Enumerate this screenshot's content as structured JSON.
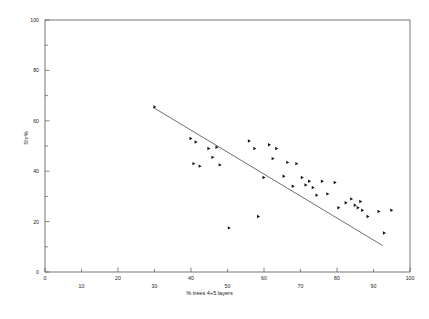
{
  "chart_data": {
    "type": "scatter",
    "title": "",
    "xlabel": "% trees 4+5 layers",
    "ylabel": "Shr%",
    "xlim": [
      0,
      100
    ],
    "ylim": [
      0,
      100
    ],
    "grid": false,
    "legend": null,
    "x_major_ticks": [
      0,
      20,
      40,
      60,
      80,
      100
    ],
    "x_minor_ticks": [
      10,
      30,
      50,
      70,
      90
    ],
    "x_tick_labels_upper": [
      "0",
      "20",
      "40",
      "60",
      "80",
      "100"
    ],
    "x_tick_labels_lower": [
      "10",
      "30",
      "50",
      "70",
      "90"
    ],
    "y_major_ticks": [
      0,
      20,
      40,
      60,
      80,
      100
    ],
    "y_minor_ticks": [
      10,
      30,
      50,
      70,
      90
    ],
    "y_tick_labels": [
      "0",
      "20",
      "40",
      "60",
      "80",
      "100"
    ],
    "marker_style": "right-pointing-triangle",
    "points": [
      {
        "x": 30.1,
        "y": 65.5
      },
      {
        "x": 40.0,
        "y": 53.0
      },
      {
        "x": 41.4,
        "y": 51.6
      },
      {
        "x": 40.8,
        "y": 43.0
      },
      {
        "x": 42.5,
        "y": 42.0
      },
      {
        "x": 44.9,
        "y": 49.0
      },
      {
        "x": 46.0,
        "y": 45.5
      },
      {
        "x": 47.1,
        "y": 49.5
      },
      {
        "x": 48.0,
        "y": 42.5
      },
      {
        "x": 56.0,
        "y": 52.0
      },
      {
        "x": 57.5,
        "y": 49.0
      },
      {
        "x": 58.5,
        "y": 22.0
      },
      {
        "x": 60.0,
        "y": 37.5
      },
      {
        "x": 61.5,
        "y": 50.5
      },
      {
        "x": 62.5,
        "y": 45.0
      },
      {
        "x": 63.5,
        "y": 49.0
      },
      {
        "x": 65.5,
        "y": 38.0
      },
      {
        "x": 66.5,
        "y": 43.5
      },
      {
        "x": 68.0,
        "y": 34.0
      },
      {
        "x": 69.0,
        "y": 43.0
      },
      {
        "x": 70.5,
        "y": 37.5
      },
      {
        "x": 71.5,
        "y": 34.5
      },
      {
        "x": 72.5,
        "y": 36.0
      },
      {
        "x": 73.5,
        "y": 33.5
      },
      {
        "x": 74.5,
        "y": 30.5
      },
      {
        "x": 76.0,
        "y": 36.0
      },
      {
        "x": 77.5,
        "y": 31.0
      },
      {
        "x": 79.5,
        "y": 35.5
      },
      {
        "x": 80.5,
        "y": 25.5
      },
      {
        "x": 82.5,
        "y": 27.5
      },
      {
        "x": 84.0,
        "y": 29.0
      },
      {
        "x": 85.0,
        "y": 26.5
      },
      {
        "x": 85.8,
        "y": 25.5
      },
      {
        "x": 86.5,
        "y": 28.0
      },
      {
        "x": 87.0,
        "y": 24.5
      },
      {
        "x": 88.5,
        "y": 22.0
      },
      {
        "x": 91.5,
        "y": 24.0
      },
      {
        "x": 95.0,
        "y": 24.5
      },
      {
        "x": 93.0,
        "y": 15.5
      },
      {
        "x": 50.5,
        "y": 17.5
      }
    ],
    "fit_line": {
      "label": "regression line",
      "x1": 30.0,
      "y1": 65.0,
      "x2": 92.5,
      "y2": 10.5
    }
  }
}
